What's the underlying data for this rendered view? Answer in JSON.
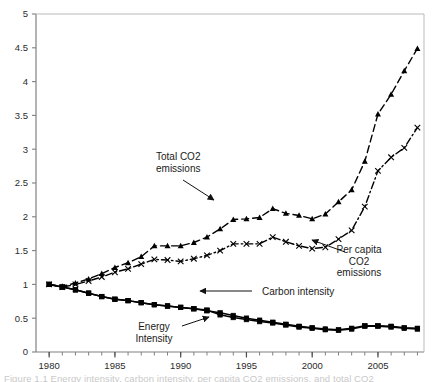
{
  "figure": {
    "title": "",
    "caption_partial": "Figure 1.1 Energy intensity, carbon intensity, per capita CO2 emissions, and total CO2",
    "background_color": "#ffffff",
    "line_color": "#000000"
  },
  "chart_data": {
    "type": "line",
    "title": "",
    "xlabel": "",
    "ylabel": "",
    "xlim": [
      1979,
      2008.5
    ],
    "ylim": [
      0,
      5
    ],
    "grid": false,
    "legend": "annotations",
    "x_ticks_major": [
      1980,
      1985,
      1990,
      1995,
      2000,
      2005
    ],
    "x_tick_labels": [
      "1980",
      "1985",
      "1990",
      "1995",
      "2000",
      "2005"
    ],
    "x_minor_tick_step": 1,
    "y_ticks": [
      0,
      0.5,
      1,
      1.5,
      2,
      2.5,
      3,
      3.5,
      4,
      4.5,
      5
    ],
    "y_tick_labels": [
      "0",
      "0.5",
      "1",
      "1.5",
      "2",
      "2.5",
      "3",
      "3.5",
      "4",
      "4.5",
      "5"
    ],
    "x": [
      1980,
      1981,
      1982,
      1983,
      1984,
      1985,
      1986,
      1987,
      1988,
      1989,
      1990,
      1991,
      1992,
      1993,
      1994,
      1995,
      1996,
      1997,
      1998,
      1999,
      2000,
      2001,
      2002,
      2003,
      2004,
      2005,
      2006,
      2007,
      2008
    ],
    "series": [
      {
        "name": "Total CO2 emissions",
        "marker": "triangle",
        "dash": "dashed",
        "values": [
          1.0,
          0.97,
          1.02,
          1.08,
          1.16,
          1.25,
          1.32,
          1.41,
          1.57,
          1.57,
          1.57,
          1.62,
          1.7,
          1.82,
          1.96,
          1.97,
          1.99,
          2.12,
          2.05,
          2.02,
          1.97,
          2.04,
          2.22,
          2.4,
          2.82,
          3.52,
          3.81,
          4.16,
          4.49
        ]
      },
      {
        "name": "Per capita CO2 emissions",
        "marker": "cross",
        "dash": "dashdot",
        "values": [
          1.0,
          0.96,
          1.0,
          1.05,
          1.11,
          1.18,
          1.23,
          1.3,
          1.37,
          1.36,
          1.34,
          1.38,
          1.43,
          1.5,
          1.6,
          1.6,
          1.6,
          1.7,
          1.63,
          1.57,
          1.53,
          1.55,
          1.67,
          1.8,
          2.15,
          2.68,
          2.88,
          3.02,
          3.32
        ]
      },
      {
        "name": "Carbon intensity",
        "marker": "square",
        "dash": "solid",
        "values": [
          1.0,
          0.96,
          0.92,
          0.87,
          0.82,
          0.78,
          0.76,
          0.73,
          0.7,
          0.68,
          0.66,
          0.64,
          0.61,
          0.58,
          0.54,
          0.5,
          0.47,
          0.44,
          0.41,
          0.38,
          0.36,
          0.34,
          0.33,
          0.35,
          0.39,
          0.39,
          0.38,
          0.36,
          0.35
        ]
      },
      {
        "name": "Energy Intensity",
        "marker": "square",
        "dash": "solid",
        "values": [
          1.0,
          0.96,
          0.92,
          0.87,
          0.82,
          0.78,
          0.76,
          0.73,
          0.7,
          0.68,
          0.66,
          0.64,
          0.62,
          0.55,
          0.51,
          0.48,
          0.45,
          0.43,
          0.4,
          0.37,
          0.35,
          0.33,
          0.32,
          0.34,
          0.38,
          0.38,
          0.37,
          0.35,
          0.34
        ]
      }
    ],
    "annotations": [
      {
        "id": "total-co2",
        "lines": [
          "Total CO2",
          "emissions"
        ],
        "text_x": 156,
        "text_y": 160,
        "align": "start",
        "arrow": {
          "x1": 183,
          "y1": 180,
          "x2": 214,
          "y2": 200
        }
      },
      {
        "id": "per-capita-co2",
        "lines": [
          "Per capita",
          "CO2",
          "emissions"
        ],
        "text_x": 359,
        "text_y": 253,
        "align": "middle",
        "arrow": {
          "x1": 345,
          "y1": 252,
          "x2": 312,
          "y2": 240
        }
      },
      {
        "id": "carbon-intensity",
        "lines": [
          "Carbon intensity"
        ],
        "text_x": 262,
        "text_y": 295,
        "align": "start",
        "arrow": {
          "x1": 252,
          "y1": 291,
          "x2": 200,
          "y2": 291
        }
      },
      {
        "id": "energy-intensity",
        "lines": [
          "Energy",
          "Intensity"
        ],
        "text_x": 154,
        "text_y": 330,
        "align": "middle",
        "arrow": {
          "x1": 182,
          "y1": 326,
          "x2": 209,
          "y2": 317
        }
      }
    ]
  }
}
